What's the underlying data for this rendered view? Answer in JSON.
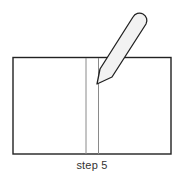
{
  "diagram": {
    "caption": "step 5",
    "elements": {
      "paper": {
        "shape": "rectangle",
        "x": 13,
        "y": 57,
        "width": 158,
        "height": 97,
        "stroke": "#222222"
      },
      "fold_lines": [
        {
          "x": 86,
          "y1": 57,
          "y2": 154,
          "stroke": "#888888"
        },
        {
          "x": 98.5,
          "y1": 57,
          "y2": 154,
          "stroke": "#888888"
        }
      ],
      "pencil": {
        "tip": [
          97,
          84
        ],
        "top_center": [
          140,
          21
        ],
        "fill": "#f2f2f2",
        "stroke": "#222222"
      }
    }
  }
}
